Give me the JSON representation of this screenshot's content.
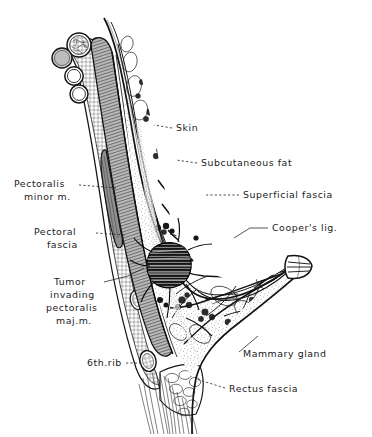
{
  "figure": {
    "background_color": "#ffffff",
    "ink_color": "#141414",
    "label_color": "#1b1b1b",
    "style": "engraved line drawing / stipple hatching",
    "orientation": "chest wall at left, nipple projecting to the right"
  },
  "labels": [
    {
      "id": "skin",
      "text": "Skin",
      "lines": [
        "Skin"
      ],
      "text_x": 176,
      "text_y": 131,
      "anchor": "start",
      "leader": "M 172 128 L 154 125",
      "side": "right"
    },
    {
      "id": "subcutaneous-fat",
      "text": "Subcutaneous fat",
      "lines": [
        "Subcutaneous fat"
      ],
      "text_x": 201,
      "text_y": 166,
      "anchor": "start",
      "leader": "M 197 163 L 176 160",
      "side": "right"
    },
    {
      "id": "superficial-fascia",
      "text": "Superficial fascia",
      "lines": [
        "Superficial fascia"
      ],
      "text_x": 243,
      "text_y": 198,
      "anchor": "start",
      "leader": "M 239 195 L 204 195",
      "side": "right"
    },
    {
      "id": "coopers-lig",
      "text": "Cooper's lig.",
      "lines": [
        "Cooper's lig."
      ],
      "text_x": 272,
      "text_y": 231,
      "anchor": "start",
      "leader": "M 268 228 L 249 228",
      "side": "right"
    },
    {
      "id": "mammary-gland",
      "text": "Mammary gland",
      "lines": [
        "Mammary gland"
      ],
      "text_x": 243,
      "text_y": 357,
      "anchor": "start",
      "leader": "M 239 352 L 258 337",
      "side": "right"
    },
    {
      "id": "rectus-fascia",
      "text": "Rectus fascia",
      "lines": [
        "Rectus fascia"
      ],
      "text_x": 229,
      "text_y": 392,
      "anchor": "start",
      "leader": "M 225 388 L 196 379",
      "side": "right"
    },
    {
      "id": "pectoralis-minor-m",
      "text": "Pectoralis minor m.",
      "lines": [
        "Pectoralis",
        "minor m."
      ],
      "text_x": 14,
      "text_y": 187,
      "anchor": "start",
      "leader": "M 79 185 L 115 188",
      "side": "left"
    },
    {
      "id": "pectoral-fascia",
      "text": "Pectoral fascia",
      "lines": [
        "Pectoral",
        "fascia"
      ],
      "text_x": 34,
      "text_y": 235,
      "anchor": "start",
      "leader": "M 96 233 L 124 235",
      "side": "left"
    },
    {
      "id": "tumor-invading-pectoralis-maj-m",
      "text": "Tumor invading pectoralis maj.m.",
      "lines": [
        "Tumor",
        "invading",
        "pectoralis",
        "maj.m."
      ],
      "text_x": 52,
      "text_y": 285,
      "anchor": "start",
      "leader": "M 104 282 L 140 272",
      "side": "left"
    },
    {
      "id": "6th-rib",
      "text": "6th.rib",
      "lines": [
        "6th.rib"
      ],
      "text_x": 87,
      "text_y": 366,
      "anchor": "start",
      "leader": "M 126 363 L 146 364",
      "side": "left"
    }
  ],
  "structures": [
    {
      "id": "ribs",
      "name": "rib cross-sections",
      "count": 4
    },
    {
      "id": "pectoralis-major",
      "name": "pectoralis major muscle"
    },
    {
      "id": "pectoralis-minor",
      "name": "pectoralis minor muscle"
    },
    {
      "id": "tumor-mass",
      "name": "tumor mass",
      "shade": "dark"
    },
    {
      "id": "nipple",
      "name": "nipple"
    },
    {
      "id": "glandular-lobules",
      "name": "mammary gland lobules"
    },
    {
      "id": "rectus-sheath",
      "name": "rectus fascia / sheath"
    }
  ]
}
